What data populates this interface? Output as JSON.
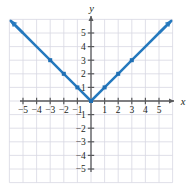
{
  "figure": {
    "name": "absolute-value-graph",
    "width": 193,
    "height": 189
  },
  "colors": {
    "curve": "#2579be",
    "marker": "#1f6fb4",
    "axis": "#58595b",
    "grid": "#d8d8e2",
    "text": "#231f20",
    "background": "#ffffff"
  },
  "axes": {
    "x_name": "x",
    "y_name": "y",
    "x_label_position": "right-of-arrow",
    "y_label_position": "above-arrow",
    "xlim": [
      -6,
      6
    ],
    "ylim": [
      -6,
      6
    ],
    "grid": true,
    "grid_step": 1,
    "tick_step": 1
  },
  "x_tick_labels": [
    {
      "value": -5,
      "text": "−5"
    },
    {
      "value": -4,
      "text": "−4"
    },
    {
      "value": -3,
      "text": "−3"
    },
    {
      "value": -2,
      "text": "−2"
    },
    {
      "value": -1,
      "text": "−1"
    },
    {
      "value": 1,
      "text": "1"
    },
    {
      "value": 2,
      "text": "2"
    },
    {
      "value": 3,
      "text": "3"
    },
    {
      "value": 4,
      "text": "4"
    },
    {
      "value": 5,
      "text": "5"
    }
  ],
  "y_tick_labels": [
    {
      "value": 5,
      "text": "5"
    },
    {
      "value": 4,
      "text": "4"
    },
    {
      "value": 3,
      "text": "3"
    },
    {
      "value": 2,
      "text": "2"
    },
    {
      "value": 1,
      "text": "1"
    },
    {
      "value": -1,
      "text": "−1"
    },
    {
      "value": -2,
      "text": "−2"
    },
    {
      "value": -3,
      "text": "−3"
    },
    {
      "value": -4,
      "text": "−4"
    },
    {
      "value": -5,
      "text": "−5"
    }
  ],
  "chart_data": {
    "type": "line",
    "title": "",
    "xlabel": "x",
    "ylabel": "y",
    "xlim": [
      -6,
      6
    ],
    "ylim": [
      -6,
      6
    ],
    "grid": true,
    "legend": "none",
    "annotations": [],
    "series": [
      {
        "name": "y = |x|",
        "equation": "y = |x|",
        "color": "#2579be",
        "arrows": [
          "start",
          "end"
        ],
        "x": [
          -5.9,
          -5,
          -4,
          -3,
          -2,
          -1,
          0,
          1,
          2,
          3,
          4,
          5,
          5.9
        ],
        "values": [
          5.9,
          5,
          4,
          3,
          2,
          1,
          0,
          1,
          2,
          3,
          4,
          5,
          5.9
        ],
        "markers": [
          {
            "x": -3,
            "y": 3
          },
          {
            "x": -2,
            "y": 2
          },
          {
            "x": -1,
            "y": 1
          },
          {
            "x": 0,
            "y": 0
          },
          {
            "x": 1,
            "y": 1
          },
          {
            "x": 2,
            "y": 2
          },
          {
            "x": 3,
            "y": 3
          }
        ]
      }
    ]
  }
}
